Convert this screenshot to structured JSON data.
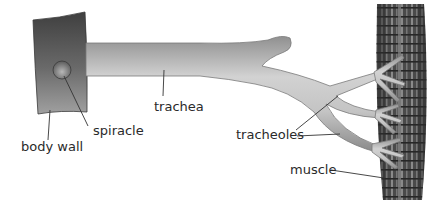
{
  "diagram": {
    "labels": {
      "body_wall": "body wall",
      "spiracle": "spiracle",
      "trachea": "trachea",
      "tracheoles": "tracheoles",
      "muscle": "muscle"
    },
    "colors": {
      "body_wall_dark": "#4a4a4a",
      "body_wall_light": "#9a9a9a",
      "tube_light": "#c8c8c8",
      "tube_dark": "#8c8c8c",
      "muscle_dark": "#3e3e3e",
      "muscle_stripe": "#8a8a8a",
      "leader_line": "#333333",
      "text": "#2a2a2a"
    }
  }
}
